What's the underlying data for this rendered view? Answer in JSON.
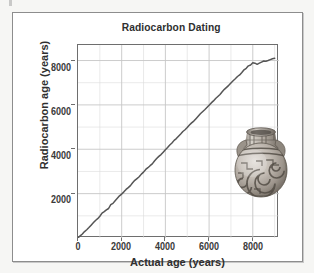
{
  "figure": {
    "title": "Radiocarbon Dating",
    "artifact_caption": "decorated-pottery-vessel"
  },
  "axes": {
    "x_title": "Actual age  (years)",
    "y_title": "Radiocarbon age  (years)",
    "x_ticks": [
      "0",
      "2000",
      "4000",
      "6000",
      "8000"
    ],
    "y_ticks": [
      "2000",
      "4000",
      "6000",
      "8000"
    ]
  },
  "colors": {
    "curve": "#555555",
    "grid_major": "#c6c6c6",
    "grid_minor": "#dcdcdc",
    "axis": "#6e6e6e",
    "frame": "#8d8d8d",
    "page_bg": "#f6f6f4",
    "plot_bg": "#ffffff",
    "text": "#2f2f2f"
  },
  "chart_data": {
    "type": "line",
    "title": "Radiocarbon Dating",
    "xlabel": "Actual age  (years)",
    "ylabel": "Radiocarbon age  (years)",
    "xlim": [
      0,
      9200
    ],
    "ylim": [
      0,
      8700
    ],
    "grid": true,
    "legend": "none",
    "x_ticks": [
      0,
      2000,
      4000,
      6000,
      8000
    ],
    "y_ticks": [
      2000,
      4000,
      6000,
      8000
    ],
    "minor_tick_step": 1000,
    "series": [
      {
        "name": "Radiocarbon calibration curve",
        "x": [
          0,
          100,
          200,
          300,
          400,
          500,
          600,
          700,
          800,
          900,
          1000,
          1100,
          1200,
          1300,
          1400,
          1500,
          1600,
          1700,
          1800,
          1900,
          2000,
          2100,
          2200,
          2300,
          2400,
          2500,
          2600,
          2700,
          2800,
          2900,
          3000,
          3100,
          3200,
          3300,
          3400,
          3500,
          3600,
          3700,
          3800,
          3900,
          4000,
          4100,
          4200,
          4300,
          4400,
          4500,
          4600,
          4700,
          4800,
          4900,
          5000,
          5100,
          5200,
          5300,
          5400,
          5500,
          5600,
          5700,
          5800,
          5900,
          6000,
          6100,
          6200,
          6300,
          6400,
          6500,
          6600,
          6700,
          6800,
          6900,
          7000,
          7100,
          7200,
          7300,
          7400,
          7500,
          7600,
          7700,
          7800,
          7900,
          8000,
          8100,
          8200,
          8300,
          8400,
          8500,
          8600,
          8700,
          8800,
          8900,
          9000
        ],
        "y": [
          10,
          95,
          180,
          290,
          370,
          470,
          580,
          690,
          790,
          870,
          980,
          1120,
          1190,
          1270,
          1330,
          1500,
          1560,
          1680,
          1790,
          1900,
          1980,
          2080,
          2190,
          2270,
          2360,
          2490,
          2600,
          2680,
          2760,
          2880,
          2970,
          3090,
          3170,
          3260,
          3340,
          3470,
          3580,
          3680,
          3760,
          3870,
          3980,
          4080,
          4190,
          4280,
          4400,
          4480,
          4590,
          4690,
          4800,
          4880,
          4980,
          5090,
          5190,
          5270,
          5380,
          5490,
          5600,
          5690,
          5780,
          5880,
          5980,
          6090,
          6180,
          6290,
          6380,
          6470,
          6590,
          6700,
          6790,
          6880,
          6990,
          7090,
          7180,
          7280,
          7350,
          7460,
          7580,
          7650,
          7760,
          7800,
          7900,
          7880,
          7830,
          7880,
          7930,
          7980,
          7970,
          8000,
          8040,
          8080,
          8100
        ],
        "color": "#555555",
        "style": "wiggly-line"
      }
    ]
  }
}
